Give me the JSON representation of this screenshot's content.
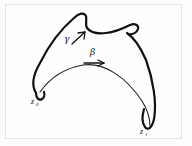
{
  "figure": {
    "background_color": "#fefefe",
    "frame_color": "#e3e3e3",
    "ink_color": "#111111",
    "labels": {
      "start_point": "z",
      "start_point_subscript": "0",
      "end_point": "z",
      "end_point_subscript": "1",
      "vector_gamma": "γ",
      "vector_beta": "β"
    },
    "annotations": [
      {
        "name": "gamma-arrow",
        "label": "γ",
        "direction": "up-right",
        "x": 78,
        "y": 35
      },
      {
        "name": "beta-arrow",
        "label": "β",
        "direction": "right",
        "x": 98,
        "y": 62
      }
    ],
    "points": [
      {
        "name": "z0",
        "label": "z",
        "subscript": "0",
        "x": 36,
        "y": 96
      },
      {
        "name": "z1",
        "label": "z",
        "subscript": "1",
        "x": 148,
        "y": 131
      }
    ],
    "curves": {
      "outer_boundary": "M 36 92 C 31 84 34 74 41 62 C 50 44 62 28 75 17 C 80 13 84 12 86 16 C 87 20 85 24 86 27 C 88 31 95 33 104 32 C 114 31 124 27 131 24 C 136 22 139 24 138 28 C 137 32 131 34 127 33 C 133 36 140 44 146 58 C 154 78 157 104 154 120 C 152 129 148 131 145 128 C 141 124 141 116 143 108",
      "inner_arc": "M 37 94 C 48 78 64 68 82 65 C 104 62 126 76 142 100 C 147 108 150 118 150 126"
    }
  }
}
